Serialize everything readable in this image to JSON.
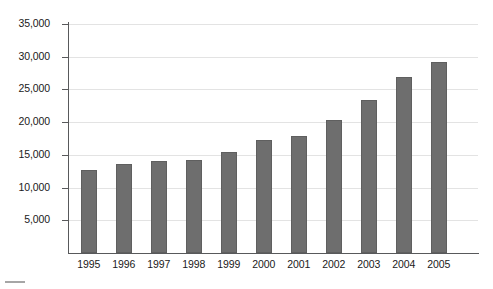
{
  "chart_data": {
    "type": "bar",
    "title": "",
    "subtitle": "",
    "xlabel": "",
    "ylabel": "",
    "categories": [
      "1995",
      "1996",
      "1997",
      "1998",
      "1999",
      "2000",
      "2001",
      "2002",
      "2003",
      "2004",
      "2005"
    ],
    "values": [
      12700,
      13600,
      14100,
      14200,
      15400,
      17300,
      17950,
      20300,
      23400,
      26900,
      29200
    ],
    "series": [
      {
        "name": "",
        "values": [
          12700,
          13600,
          14100,
          14200,
          15400,
          17300,
          17950,
          20300,
          23400,
          26900,
          29200
        ]
      }
    ],
    "ylim": [
      0,
      35000
    ],
    "yticks": [
      5000,
      10000,
      15000,
      20000,
      25000,
      30000,
      35000
    ],
    "ytick_labels": [
      "5,000",
      "10,000",
      "15,000",
      "20,000",
      "25,000",
      "30,000",
      "35,000"
    ],
    "grid": true,
    "legend": false,
    "legend_position": "none",
    "bar_color": "#6e6e6e",
    "bar_edge_color": "#5f5f5f",
    "gridline_color": "#e3e3e3",
    "axis_color": "#58595b",
    "background_color": "#ffffff"
  }
}
